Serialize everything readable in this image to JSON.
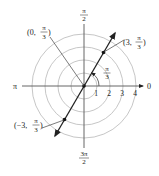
{
  "diagram": {
    "type": "polar-plot",
    "center": [
      84,
      86
    ],
    "unit_px": 13,
    "circle_radii": [
      1,
      2,
      3,
      4
    ],
    "axis_labels": {
      "right": "0",
      "left": "π",
      "top_num": "π",
      "top_den": "2",
      "bottom_num": "3π",
      "bottom_den": "2"
    },
    "tick_labels": [
      "1",
      "2",
      "3",
      "4"
    ],
    "line": {
      "theta_label_num": "π",
      "theta_label_den": "3"
    },
    "points": [
      {
        "label_prefix": "(3,",
        "num": "π",
        "den": "3",
        "suffix": ")"
      },
      {
        "label_prefix": "(−3,",
        "num": "π",
        "den": "3",
        "suffix": ")"
      },
      {
        "label_prefix": "(0,",
        "num": "π",
        "den": "3",
        "suffix": ")"
      }
    ],
    "colors": {
      "circles": "#b8b8b8",
      "axes": "#555555",
      "line": "#222222"
    }
  }
}
